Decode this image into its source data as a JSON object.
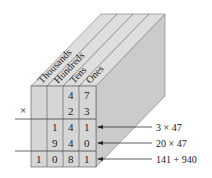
{
  "diagram": {
    "columns": [
      "Thousands",
      "Hundreds",
      "Tens",
      "Ones"
    ],
    "operator": "×",
    "rows": [
      {
        "cells": [
          "",
          "",
          "4",
          "7"
        ]
      },
      {
        "cells": [
          "",
          "",
          "2",
          "3"
        ]
      },
      {
        "cells": [
          "",
          "1",
          "4",
          "1"
        ],
        "annotation": "3 × 47"
      },
      {
        "cells": [
          "",
          "9",
          "4",
          "0"
        ],
        "annotation": "20 × 47"
      },
      {
        "cells": [
          "1",
          "0",
          "8",
          "1"
        ],
        "annotation": "141 + 940"
      }
    ],
    "colors": {
      "face": "#d4d4d4",
      "top": "#dcdcdc",
      "side": "#c8c8c8",
      "lines": "#555555"
    }
  }
}
